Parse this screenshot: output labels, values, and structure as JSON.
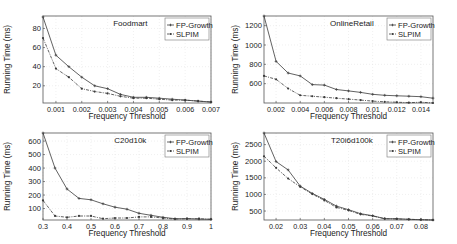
{
  "chart_data": [
    {
      "type": "line",
      "title": "Foodmart",
      "xlabel": "Frequency Threshold",
      "ylabel": "Running Time (ms)",
      "x": [
        0.0005,
        0.001,
        0.0015,
        0.002,
        0.0025,
        0.003,
        0.0035,
        0.004,
        0.0045,
        0.005,
        0.0055,
        0.006,
        0.0065,
        0.007
      ],
      "xlim": [
        0.0005,
        0.007
      ],
      "ylim": [
        2,
        93
      ],
      "xticks": [
        0.001,
        0.002,
        0.003,
        0.004,
        0.005,
        0.006,
        0.007
      ],
      "xtick_labels": [
        "0.001",
        "0.002",
        "0.003",
        "0.004",
        "0.005",
        "0.006",
        "0.007"
      ],
      "yticks": [
        20,
        40,
        60,
        80
      ],
      "ytick_labels": [
        "20",
        "40",
        "60",
        "80"
      ],
      "grid": true,
      "legend_position": "upper right",
      "series": [
        {
          "name": "FP-Growth",
          "values": [
            92,
            52,
            40,
            29,
            20,
            17,
            11,
            8,
            8,
            7,
            6,
            5,
            4,
            3
          ]
        },
        {
          "name": "SLPIM",
          "values": [
            70,
            38,
            29,
            17,
            14,
            12,
            9,
            7,
            7,
            6,
            5,
            5,
            4,
            3
          ]
        }
      ]
    },
    {
      "type": "line",
      "title": "OnlineRetail",
      "xlabel": "Frequency Threshold",
      "ylabel": "Running Time (ms)",
      "x": [
        0.001,
        0.002,
        0.003,
        0.004,
        0.005,
        0.006,
        0.007,
        0.008,
        0.009,
        0.01,
        0.011,
        0.012,
        0.013,
        0.014,
        0.015
      ],
      "xlim": [
        0.001,
        0.015
      ],
      "ylim": [
        400,
        1300
      ],
      "xticks": [
        0.002,
        0.004,
        0.006,
        0.008,
        0.01,
        0.012,
        0.014
      ],
      "xtick_labels": [
        "0.002",
        "0.004",
        "0.006",
        "0.008",
        "0.01",
        "0.012",
        "0.014"
      ],
      "yticks": [
        600,
        800,
        1000,
        1200
      ],
      "ytick_labels": [
        "600",
        "800",
        "1000",
        "1200"
      ],
      "grid": true,
      "legend_position": "upper right",
      "series": [
        {
          "name": "FP-Growth",
          "values": [
            1300,
            830,
            710,
            680,
            590,
            585,
            540,
            525,
            510,
            490,
            480,
            475,
            470,
            465,
            450
          ]
        },
        {
          "name": "SLPIM",
          "values": [
            680,
            645,
            550,
            480,
            470,
            460,
            450,
            440,
            430,
            420,
            412,
            408,
            403,
            408,
            400
          ]
        }
      ]
    },
    {
      "type": "line",
      "title": "C20d10k",
      "xlabel": "Frequency Threshold",
      "ylabel": "Running Time (ms)",
      "x": [
        0.3,
        0.35,
        0.4,
        0.45,
        0.5,
        0.55,
        0.6,
        0.65,
        0.7,
        0.75,
        0.8,
        0.85,
        0.9,
        0.95,
        1.0
      ],
      "xlim": [
        0.3,
        1.0
      ],
      "ylim": [
        15,
        660
      ],
      "xticks": [
        0.3,
        0.4,
        0.5,
        0.6,
        0.7,
        0.8,
        0.9,
        1.0
      ],
      "xtick_labels": [
        "0.3",
        "0.4",
        "0.5",
        "0.6",
        "0.7",
        "0.8",
        "0.9",
        "1"
      ],
      "yticks": [
        100,
        200,
        300,
        400,
        500,
        600
      ],
      "ytick_labels": [
        "100",
        "200",
        "300",
        "400",
        "500",
        "600"
      ],
      "grid": true,
      "legend_position": "upper right",
      "series": [
        {
          "name": "FP-Growth",
          "values": [
            660,
            400,
            245,
            175,
            165,
            135,
            110,
            95,
            65,
            50,
            35,
            25,
            25,
            22,
            20
          ]
        },
        {
          "name": "SLPIM",
          "values": [
            160,
            45,
            35,
            45,
            45,
            25,
            30,
            30,
            38,
            38,
            30,
            22,
            25,
            25,
            20
          ]
        }
      ]
    },
    {
      "type": "line",
      "title": "T20i6d100k",
      "xlabel": "Frequency Threshold",
      "ylabel": "Running Time (ms)",
      "x": [
        0.015,
        0.02,
        0.025,
        0.03,
        0.035,
        0.04,
        0.045,
        0.05,
        0.055,
        0.06,
        0.065,
        0.07,
        0.075,
        0.08,
        0.085
      ],
      "xlim": [
        0.015,
        0.085
      ],
      "ylim": [
        230,
        2850
      ],
      "xticks": [
        0.02,
        0.03,
        0.04,
        0.05,
        0.06,
        0.07,
        0.08
      ],
      "xtick_labels": [
        "0.02",
        "0.03",
        "0.04",
        "0.05",
        "0.06",
        "0.07",
        "0.08"
      ],
      "yticks": [
        500,
        1000,
        1500,
        2000,
        2500
      ],
      "ytick_labels": [
        "500",
        "1000",
        "1500",
        "2000",
        "2500"
      ],
      "grid": true,
      "legend_position": "upper right",
      "series": [
        {
          "name": "FP-Growth",
          "values": [
            2850,
            1990,
            1740,
            1250,
            1030,
            850,
            650,
            540,
            420,
            360,
            270,
            270,
            250,
            240,
            230
          ]
        },
        {
          "name": "SLPIM",
          "values": [
            2150,
            1800,
            1480,
            1230,
            1010,
            820,
            610,
            520,
            400,
            350,
            270,
            260,
            250,
            240,
            230
          ]
        }
      ]
    }
  ],
  "panels": [
    {
      "title": "Foodmart"
    },
    {
      "title": "OnlineRetail"
    },
    {
      "title": "C20d10k"
    },
    {
      "title": "T20i6d100k"
    }
  ],
  "legend": {
    "fp_growth": "FP-Growth",
    "slpim": "SLPIM"
  },
  "axis_labels": {
    "x": "Frequency Threshold",
    "y": "Running Time (ms)"
  },
  "colors": {
    "line": "#3a3a3a",
    "axis": "#555555",
    "grid": "#e6e6e6",
    "text": "#222222"
  }
}
